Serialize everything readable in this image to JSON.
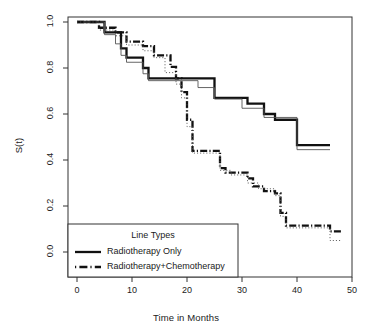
{
  "chart_data": {
    "type": "line",
    "subtype": "kaplan-meier-step",
    "title": "",
    "xlabel": "Time in Months",
    "ylabel": "S(t)",
    "xlim": [
      0,
      50
    ],
    "ylim": [
      0.0,
      1.0
    ],
    "xticks": [
      0,
      10,
      20,
      30,
      40,
      50
    ],
    "xtick_labels": [
      "0",
      "10",
      "20",
      "30",
      "40",
      "50"
    ],
    "yticks": [
      0.0,
      0.2,
      0.4,
      0.6,
      0.8,
      1.0
    ],
    "ytick_labels": [
      "0.0",
      "0.2",
      "0.4",
      "0.6",
      "0.8",
      "1.0"
    ],
    "grid": false,
    "box": true,
    "legend": {
      "title": "Line Types",
      "position": "bottom-left",
      "entries": [
        {
          "label": "Radiotherapy Only",
          "style": "solid",
          "width": "thick"
        },
        {
          "label": "Radiotherapy+Chemotherapy",
          "style": "dash-dot",
          "width": "thick"
        }
      ]
    },
    "series": [
      {
        "name": "Radiotherapy Only",
        "style": "solid",
        "width": "thick",
        "points": [
          [
            0,
            1.0
          ],
          [
            5,
            1.0
          ],
          [
            5,
            0.955
          ],
          [
            8,
            0.955
          ],
          [
            8,
            0.885
          ],
          [
            9,
            0.885
          ],
          [
            9,
            0.845
          ],
          [
            12,
            0.845
          ],
          [
            12,
            0.8
          ],
          [
            13,
            0.8
          ],
          [
            13,
            0.755
          ],
          [
            25,
            0.755
          ],
          [
            25,
            0.67
          ],
          [
            31,
            0.67
          ],
          [
            31,
            0.645
          ],
          [
            34,
            0.645
          ],
          [
            34,
            0.6
          ],
          [
            36,
            0.6
          ],
          [
            36,
            0.575
          ],
          [
            40,
            0.575
          ],
          [
            40,
            0.465
          ],
          [
            46,
            0.465
          ]
        ]
      },
      {
        "name": "Radiotherapy Only (confidence/secondary)",
        "style": "solid",
        "width": "thin",
        "points": [
          [
            0,
            1.0
          ],
          [
            5,
            1.0
          ],
          [
            5,
            0.945
          ],
          [
            7,
            0.945
          ],
          [
            7,
            0.905
          ],
          [
            8,
            0.905
          ],
          [
            8,
            0.855
          ],
          [
            9,
            0.855
          ],
          [
            9,
            0.825
          ],
          [
            12,
            0.825
          ],
          [
            12,
            0.775
          ],
          [
            13,
            0.775
          ],
          [
            13,
            0.745
          ],
          [
            22,
            0.745
          ],
          [
            22,
            0.715
          ],
          [
            25,
            0.715
          ],
          [
            25,
            0.665
          ],
          [
            30,
            0.665
          ],
          [
            30,
            0.625
          ],
          [
            34,
            0.625
          ],
          [
            34,
            0.585
          ],
          [
            40,
            0.585
          ],
          [
            40,
            0.445
          ],
          [
            46,
            0.445
          ]
        ]
      },
      {
        "name": "Radiotherapy+Chemotherapy",
        "style": "dash-dot",
        "width": "thick",
        "points": [
          [
            0,
            1.0
          ],
          [
            4,
            1.0
          ],
          [
            4,
            0.975
          ],
          [
            7,
            0.975
          ],
          [
            7,
            0.955
          ],
          [
            9,
            0.955
          ],
          [
            9,
            0.915
          ],
          [
            12,
            0.915
          ],
          [
            12,
            0.895
          ],
          [
            14,
            0.895
          ],
          [
            14,
            0.855
          ],
          [
            17,
            0.855
          ],
          [
            17,
            0.805
          ],
          [
            18,
            0.805
          ],
          [
            18,
            0.755
          ],
          [
            19,
            0.755
          ],
          [
            19,
            0.695
          ],
          [
            20,
            0.695
          ],
          [
            20,
            0.575
          ],
          [
            21,
            0.575
          ],
          [
            21,
            0.44
          ],
          [
            25,
            0.44
          ],
          [
            25,
            0.44
          ],
          [
            26,
            0.44
          ],
          [
            26,
            0.365
          ],
          [
            27,
            0.365
          ],
          [
            27,
            0.345
          ],
          [
            31,
            0.345
          ],
          [
            31,
            0.32
          ],
          [
            32,
            0.32
          ],
          [
            32,
            0.285
          ],
          [
            34,
            0.285
          ],
          [
            34,
            0.265
          ],
          [
            36,
            0.265
          ],
          [
            36,
            0.255
          ],
          [
            37,
            0.255
          ],
          [
            37,
            0.17
          ],
          [
            38,
            0.17
          ],
          [
            38,
            0.115
          ],
          [
            46,
            0.115
          ],
          [
            46,
            0.09
          ],
          [
            48,
            0.09
          ]
        ]
      },
      {
        "name": "Radiotherapy+Chemotherapy (confidence/secondary)",
        "style": "dotted",
        "width": "thin",
        "points": [
          [
            0,
            1.0
          ],
          [
            4,
            1.0
          ],
          [
            4,
            0.965
          ],
          [
            7,
            0.965
          ],
          [
            7,
            0.94
          ],
          [
            9,
            0.94
          ],
          [
            9,
            0.9
          ],
          [
            12,
            0.9
          ],
          [
            12,
            0.875
          ],
          [
            14,
            0.875
          ],
          [
            14,
            0.845
          ],
          [
            16,
            0.845
          ],
          [
            16,
            0.78
          ],
          [
            18,
            0.78
          ],
          [
            18,
            0.73
          ],
          [
            19,
            0.73
          ],
          [
            19,
            0.67
          ],
          [
            20,
            0.67
          ],
          [
            20,
            0.545
          ],
          [
            21,
            0.545
          ],
          [
            21,
            0.43
          ],
          [
            26,
            0.43
          ],
          [
            26,
            0.355
          ],
          [
            28,
            0.355
          ],
          [
            28,
            0.335
          ],
          [
            31,
            0.335
          ],
          [
            31,
            0.3
          ],
          [
            33,
            0.3
          ],
          [
            33,
            0.275
          ],
          [
            36,
            0.275
          ],
          [
            36,
            0.245
          ],
          [
            37,
            0.245
          ],
          [
            37,
            0.155
          ],
          [
            38,
            0.155
          ],
          [
            38,
            0.105
          ],
          [
            46,
            0.105
          ],
          [
            46,
            0.05
          ],
          [
            48,
            0.05
          ]
        ]
      }
    ]
  },
  "colors": {
    "line": "#111111",
    "axis": "#333333",
    "background": "#ffffff",
    "thin_line": "#555555"
  }
}
